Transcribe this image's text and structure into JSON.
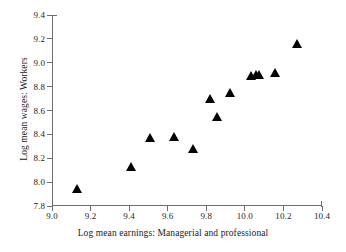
{
  "chart_data": {
    "type": "scatter",
    "title": "",
    "xlabel": "Log mean earnings: Managerial and professional",
    "ylabel": "Log mean wages: Workers",
    "xlim": [
      9.0,
      10.4
    ],
    "ylim": [
      7.8,
      9.4
    ],
    "xticks": [
      "9.0",
      "9.2",
      "9.4",
      "9.6",
      "9.8",
      "10.0",
      "10.2",
      "10.4"
    ],
    "xtick_values": [
      9.0,
      9.2,
      9.4,
      9.6,
      9.8,
      10.0,
      10.2,
      10.4
    ],
    "yticks": [
      "7.8",
      "8.0",
      "8.2",
      "8.4",
      "8.6",
      "8.8",
      "9.0",
      "9.2",
      "9.4"
    ],
    "ytick_values": [
      7.8,
      8.0,
      8.2,
      8.4,
      8.6,
      8.8,
      9.0,
      9.2,
      9.4
    ],
    "grid": false,
    "legend": false,
    "marker": "filled-triangle",
    "marker_color": "#000000",
    "axis_color": "#6d6d6d",
    "background": "#ffffff",
    "series": [
      {
        "name": "Occupation groups",
        "points": [
          {
            "x": 9.13,
            "y": 7.945
          },
          {
            "x": 9.41,
            "y": 8.135
          },
          {
            "x": 9.51,
            "y": 8.37
          },
          {
            "x": 9.63,
            "y": 8.38
          },
          {
            "x": 9.73,
            "y": 8.28
          },
          {
            "x": 9.82,
            "y": 8.7
          },
          {
            "x": 9.855,
            "y": 8.55
          },
          {
            "x": 9.925,
            "y": 8.75
          },
          {
            "x": 10.03,
            "y": 8.89
          },
          {
            "x": 10.06,
            "y": 8.9
          },
          {
            "x": 10.075,
            "y": 8.9
          },
          {
            "x": 10.155,
            "y": 8.915
          },
          {
            "x": 10.27,
            "y": 9.16
          }
        ]
      }
    ]
  }
}
